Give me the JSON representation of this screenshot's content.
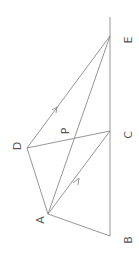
{
  "diagram": {
    "labels": {
      "A": "A",
      "B": "B",
      "C": "C",
      "D": "D",
      "E": "E",
      "P": "P"
    },
    "points": {
      "A": [
        48,
        214
      ],
      "B": [
        110,
        236
      ],
      "C": [
        110,
        131
      ],
      "D": [
        27,
        148
      ],
      "E": [
        110,
        36
      ],
      "P": [
        73,
        140
      ],
      "top": [
        110,
        17
      ]
    },
    "segments": [
      [
        "B",
        "top"
      ],
      [
        "B",
        "A"
      ],
      [
        "A",
        "D"
      ],
      [
        "D",
        "E"
      ],
      [
        "D",
        "C"
      ],
      [
        "A",
        "C"
      ],
      [
        "A",
        "E"
      ]
    ],
    "arrows": [
      "D-E",
      "A-C"
    ],
    "line_color": "#8a8a8a",
    "label_color": "#555555"
  }
}
